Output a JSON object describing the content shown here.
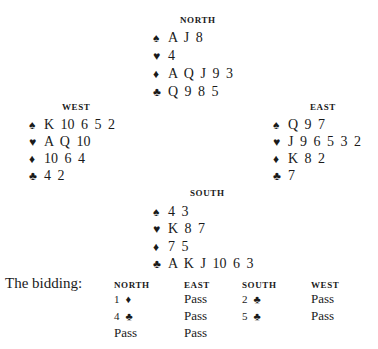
{
  "hands": {
    "north": {
      "label": "NORTH",
      "spades": "A J 8",
      "hearts": "4",
      "diamonds": "A Q J 9 3",
      "clubs": "Q 9 8 5"
    },
    "west": {
      "label": "WEST",
      "spades": "K 10 6 5 2",
      "hearts": "A Q 10",
      "diamonds": "10 6 4",
      "clubs": "4 2"
    },
    "east": {
      "label": "EAST",
      "spades": "Q 9 7",
      "hearts": "J 9 6 5 3 2",
      "diamonds": "K 8 2",
      "clubs": "7"
    },
    "south": {
      "label": "SOUTH",
      "spades": "4 3",
      "hearts": "K 8 7",
      "diamonds": "7 5",
      "clubs": "A K J 10 6 3"
    }
  },
  "suit_symbols": {
    "spades": "♠",
    "hearts": "♥",
    "diamonds": "♦",
    "clubs": "♣"
  },
  "bidding": {
    "title": "The bidding:",
    "headers": [
      "NORTH",
      "EAST",
      "SOUTH",
      "WEST"
    ],
    "rounds": [
      [
        {
          "level": "1",
          "suit": "♦"
        },
        {
          "text": "Pass"
        },
        {
          "level": "2",
          "suit": "♣"
        },
        {
          "text": "Pass"
        }
      ],
      [
        {
          "level": "4",
          "suit": "♣"
        },
        {
          "text": "Pass"
        },
        {
          "level": "5",
          "suit": "♣"
        },
        {
          "text": "Pass"
        }
      ],
      [
        {
          "text": "Pass"
        },
        {
          "text": "Pass"
        }
      ]
    ]
  }
}
